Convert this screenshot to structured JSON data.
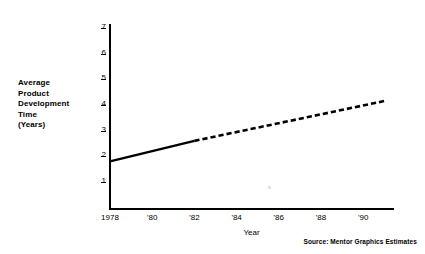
{
  "figure": {
    "background_color": "#ffffff",
    "ink_color": "#000000"
  },
  "y_axis_title_lines": [
    "Average",
    "Product",
    "Development",
    "Time",
    "(Years)"
  ],
  "x_axis_title": "Year",
  "source_note": "Source: Mentor Graphics Estimates",
  "chart_data": {
    "type": "line",
    "title": "",
    "xlabel": "Year",
    "ylabel": "Average Product Development Time (Years)",
    "xlim": [
      1978,
      1991.5
    ],
    "ylim": [
      0,
      7.4
    ],
    "grid": false,
    "legend": "none",
    "x_tick_labels": [
      "1978",
      "'80",
      "'82",
      "'84",
      "'86",
      "'88",
      "'90"
    ],
    "x_tick_values": [
      1978,
      1980,
      1982,
      1984,
      1986,
      1988,
      1990
    ],
    "y_tick_labels": [
      "1",
      "2",
      "3",
      "4",
      "5",
      "6",
      "7"
    ],
    "y_tick_values": [
      1,
      2,
      3,
      4,
      5,
      6,
      7
    ],
    "series": [
      {
        "name": "Actual",
        "style": "solid",
        "x": [
          1978,
          1982
        ],
        "values": [
          1.8,
          2.6
        ]
      },
      {
        "name": "Projected",
        "style": "dashed",
        "x": [
          1982,
          1991
        ],
        "values": [
          2.6,
          4.15
        ]
      }
    ]
  }
}
